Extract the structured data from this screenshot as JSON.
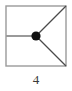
{
  "figure": {
    "caption": "4",
    "background_color": "#ffffff"
  },
  "diagram_data": {
    "type": "diagram",
    "description": "Square frame containing a single filled node with three straight edges",
    "frame": {
      "shape": "square",
      "x": 6,
      "y": 6,
      "width": 60,
      "height": 60,
      "stroke_color": "#9a9a9a",
      "stroke_width": 1.4,
      "fill": "none"
    },
    "nodes": [
      {
        "id": "center-node",
        "cx": 36,
        "cy": 36,
        "r": 4.6,
        "fill_color": "#111111",
        "label": ""
      }
    ],
    "edges": [
      {
        "id": "edge-left",
        "from": {
          "x": 6,
          "y": 36
        },
        "to": {
          "x": 36,
          "y": 36
        },
        "stroke_color": "#9a9a9a",
        "stroke_width": 2.0,
        "orientation": "horizontal"
      },
      {
        "id": "edge-top-right",
        "from": {
          "x": 36,
          "y": 36
        },
        "to": {
          "x": 66,
          "y": 6
        },
        "stroke_color": "#4a4a4a",
        "stroke_width": 1.3,
        "orientation": "diagonal-up-right"
      },
      {
        "id": "edge-bottom-right",
        "from": {
          "x": 36,
          "y": 36
        },
        "to": {
          "x": 66,
          "y": 66
        },
        "stroke_color": "#4a4a4a",
        "stroke_width": 1.3,
        "orientation": "diagonal-down-right"
      }
    ],
    "node_count": 1,
    "edge_count": 3,
    "caption": "4"
  }
}
